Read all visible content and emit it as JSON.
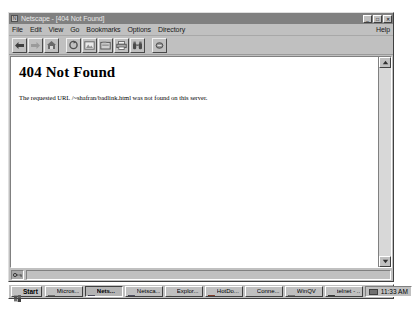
{
  "window": {
    "title": "Netscape - [404 Not Found]",
    "app_icon": "netscape-icon",
    "controls": [
      {
        "name": "minimize-button",
        "glyph": "_"
      },
      {
        "name": "maximize-button",
        "glyph": "□"
      },
      {
        "name": "close-button",
        "glyph": "✕"
      }
    ]
  },
  "menu": {
    "items": [
      {
        "label": "File"
      },
      {
        "label": "Edit"
      },
      {
        "label": "View"
      },
      {
        "label": "Go"
      },
      {
        "label": "Bookmarks"
      },
      {
        "label": "Options"
      },
      {
        "label": "Directory"
      }
    ],
    "help_label": "Help"
  },
  "toolbar": {
    "buttons": [
      {
        "name": "back-button",
        "icon": "back-arrow-icon",
        "label": "Back"
      },
      {
        "name": "forward-button",
        "icon": "forward-arrow-icon",
        "label": "Forward"
      },
      {
        "name": "home-button",
        "icon": "home-icon",
        "label": "Home"
      },
      {
        "name": "reload-button",
        "icon": "reload-icon",
        "label": "Reload"
      },
      {
        "name": "images-button",
        "icon": "images-icon",
        "label": "Images"
      },
      {
        "name": "open-button",
        "icon": "open-icon",
        "label": "Open"
      },
      {
        "name": "print-button",
        "icon": "printer-icon",
        "label": "Print"
      },
      {
        "name": "find-button",
        "icon": "binoculars-icon",
        "label": "Find"
      },
      {
        "name": "stop-button",
        "icon": "stop-icon",
        "label": "Stop"
      }
    ]
  },
  "page": {
    "heading": "404 Not Found",
    "body": "The requested URL /~shafran/badlink.html was not found on this server."
  },
  "status": {
    "security_icon": "broken-key-icon",
    "text": ""
  },
  "scrollbar": {
    "up_icon": "scroll-up-arrow-icon",
    "down_icon": "scroll-down-arrow-icon"
  },
  "taskbar": {
    "start_label": "Start",
    "start_icon": "windows-logo-icon",
    "buttons": [
      {
        "label": "Micros...",
        "icon": "word-icon",
        "active": false
      },
      {
        "label": "Nets...",
        "icon": "netscape-icon",
        "active": true
      },
      {
        "label": "Netsca...",
        "icon": "netscape-icon",
        "active": false
      },
      {
        "label": "Explor...",
        "icon": "explorer-icon",
        "active": false
      },
      {
        "label": "HotDo...",
        "icon": "hotdog-icon",
        "active": false
      },
      {
        "label": "Conne...",
        "icon": "connection-icon",
        "active": false
      },
      {
        "label": "WinQV",
        "icon": "winqvt-icon",
        "active": false
      },
      {
        "label": "telnet - ...",
        "icon": "telnet-icon",
        "active": false
      }
    ],
    "tray_icon": "modem-icon",
    "clock": "11:33 AM"
  }
}
